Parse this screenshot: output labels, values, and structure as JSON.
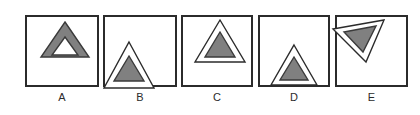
{
  "figure": {
    "title": "",
    "type": "shape-comparison-panels",
    "canvas": {
      "width": 420,
      "height": 115
    },
    "colors": {
      "background": "#ffffff",
      "box_stroke": "#2b2b2b",
      "shape_stroke": "#3a3a3a",
      "shape_stroke_dark": "#2b2b2b",
      "fill_gray": "#808080",
      "fill_white": "#ffffff",
      "label_text": "#2b2b2b"
    },
    "panels": [
      {
        "id": "A",
        "label": "A",
        "box": {
          "x": 25,
          "y": 15,
          "width": 74,
          "height": 72
        },
        "label_x": 25,
        "label_y": 90,
        "label_width": 74,
        "description": "large thick gray triangular ring with white interior, centered, apex up",
        "shapes": [
          {
            "name": "outer-triangle",
            "points": "65,22 89,57 41,57",
            "fill": "#808080",
            "stroke": "#3a3a3a",
            "stroke_width": 1.4
          },
          {
            "name": "inner-triangle",
            "points": "65,37 78,55 52,55",
            "fill": "#ffffff",
            "stroke": "#3a3a3a",
            "stroke_width": 1.4
          }
        ]
      },
      {
        "id": "B",
        "label": "B",
        "box": {
          "x": 103,
          "y": 15,
          "width": 74,
          "height": 72
        },
        "label_x": 103,
        "label_y": 90,
        "label_width": 74,
        "description": "outlined triangle low-left with small gray filled triangle inside, base overflows box bottom",
        "shapes": [
          {
            "name": "outer-triangle",
            "points": "129,42 154,88 104,88",
            "fill": "#ffffff",
            "stroke": "#2b2b2b",
            "stroke_width": 1.4
          },
          {
            "name": "inner-triangle",
            "points": "129,56 144,81 114,81",
            "fill": "#808080",
            "stroke": "#3a3a3a",
            "stroke_width": 1.4
          }
        ]
      },
      {
        "id": "C",
        "label": "C",
        "box": {
          "x": 181,
          "y": 15,
          "width": 72,
          "height": 72
        },
        "label_x": 181,
        "label_y": 90,
        "label_width": 72,
        "description": "outlined triangle upper area with gray filled triangle inside, apex near top edge",
        "shapes": [
          {
            "name": "outer-triangle",
            "points": "220,20 245,62 195,62",
            "fill": "#ffffff",
            "stroke": "#2b2b2b",
            "stroke_width": 1.4
          },
          {
            "name": "inner-triangle",
            "points": "220,32 235,57 205,57",
            "fill": "#808080",
            "stroke": "#3a3a3a",
            "stroke_width": 1.4
          }
        ]
      },
      {
        "id": "D",
        "label": "D",
        "box": {
          "x": 258,
          "y": 15,
          "width": 72,
          "height": 72
        },
        "label_x": 258,
        "label_y": 90,
        "label_width": 72,
        "description": "outlined triangle lower-centre with gray filled triangle inside, base near box bottom",
        "shapes": [
          {
            "name": "outer-triangle",
            "points": "294,45 317,85 271,85",
            "fill": "#ffffff",
            "stroke": "#2b2b2b",
            "stroke_width": 1.4
          },
          {
            "name": "inner-triangle",
            "points": "294,57 308,80 280,80",
            "fill": "#808080",
            "stroke": "#3a3a3a",
            "stroke_width": 1.4
          }
        ]
      },
      {
        "id": "E",
        "label": "E",
        "box": {
          "x": 335,
          "y": 15,
          "width": 73,
          "height": 72
        },
        "label_x": 335,
        "label_y": 90,
        "label_width": 73,
        "description": "rotated/tilted triangle outline pointing down-left with gray filled triangle inside, overflows left box edge",
        "shapes": [
          {
            "name": "outer-triangle",
            "points": "333,29 384,20 366,62",
            "fill": "#ffffff",
            "stroke": "#2b2b2b",
            "stroke_width": 1.4
          },
          {
            "name": "inner-triangle",
            "points": "344,32 376,26 363,52",
            "fill": "#808080",
            "stroke": "#3a3a3a",
            "stroke_width": 1.4
          }
        ]
      }
    ]
  }
}
